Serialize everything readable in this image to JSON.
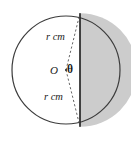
{
  "figure": {
    "name": "circle-with-shaded-segment",
    "background_color": "#ffffff",
    "shade_color": "#cccccc",
    "outline_color": "#3c3c3c",
    "chord_color": "#262626",
    "dash_color": "#555555",
    "labels": {
      "radius_top": {
        "symbol": "r",
        "unit": "cm",
        "text": "r cm"
      },
      "radius_bottom": {
        "symbol": "r",
        "unit": "cm",
        "text": "r cm"
      },
      "centre": "O",
      "angle": "θ"
    },
    "geometry": {
      "centre_x": 66,
      "centre_y": 70,
      "radius": 54,
      "chord_x": 80,
      "chord_top_y": 13,
      "chord_bottom_y": 127
    }
  }
}
